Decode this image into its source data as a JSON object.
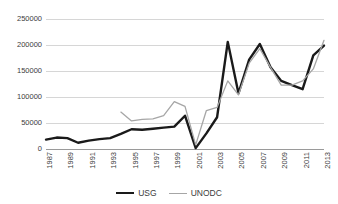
{
  "chart_data": {
    "type": "line",
    "title": "",
    "xlabel": "",
    "ylabel": "",
    "x": [
      1987,
      1988,
      1989,
      1990,
      1991,
      1992,
      1993,
      1994,
      1995,
      1996,
      1997,
      1998,
      1999,
      2000,
      2001,
      2002,
      2003,
      2004,
      2005,
      2006,
      2007,
      2008,
      2009,
      2010,
      2011,
      2012,
      2013
    ],
    "xlim": [
      1987,
      2013
    ],
    "ylim": [
      0,
      250000
    ],
    "yticks": [
      0,
      50000,
      100000,
      150000,
      200000,
      250000
    ],
    "ytick_labels": [
      "0",
      "50000",
      "100000",
      "150000",
      "200000",
      "250000"
    ],
    "xtick_labels": [
      "1987",
      "1989",
      "1991",
      "1993",
      "1995",
      "1997",
      "1999",
      "2001",
      "2003",
      "2005",
      "2007",
      "2009",
      "2011",
      "2013"
    ],
    "xticks": [
      1987,
      1989,
      1991,
      1993,
      1995,
      1997,
      1999,
      2001,
      2003,
      2005,
      2007,
      2009,
      2011,
      2013
    ],
    "grid": true,
    "legend_position": "bottom",
    "series": [
      {
        "name": "USG",
        "color": "#1a1a1a",
        "width": 2.4,
        "x": [
          1987,
          1988,
          1989,
          1990,
          1991,
          1992,
          1993,
          1994,
          1995,
          1996,
          1997,
          1998,
          1999,
          2000,
          2001,
          2002,
          2003,
          2004,
          2005,
          2006,
          2007,
          2008,
          2009,
          2010,
          2011,
          2012,
          2013
        ],
        "values": [
          18000,
          22000,
          21000,
          12000,
          16000,
          19000,
          21000,
          29000,
          38000,
          37000,
          39000,
          41000,
          43000,
          64000,
          1700,
          30000,
          61000,
          206000,
          107000,
          172000,
          202000,
          157000,
          131000,
          123000,
          115000,
          180000,
          199000
        ]
      },
      {
        "name": "UNODC",
        "color": "#a6a6a6",
        "width": 1.3,
        "x": [
          1994,
          1995,
          1996,
          1997,
          1998,
          1999,
          2000,
          2001,
          2002,
          2003,
          2004,
          2005,
          2006,
          2007,
          2008,
          2009,
          2010,
          2011,
          2012,
          2013
        ],
        "values": [
          71000,
          54000,
          57000,
          58000,
          64000,
          91000,
          82000,
          8000,
          74000,
          80000,
          131000,
          104000,
          165000,
          193000,
          157000,
          123000,
          123000,
          131000,
          154000,
          209000
        ]
      }
    ]
  },
  "legend": {
    "items": [
      {
        "label": "USG"
      },
      {
        "label": "UNODC"
      }
    ]
  },
  "colors": {
    "usg": "#1a1a1a",
    "unodc": "#a6a6a6",
    "gridline": "#d6d6d6",
    "axis": "#9a9a9a",
    "background": "#ffffff",
    "tick_text": "#3c3c3c"
  }
}
